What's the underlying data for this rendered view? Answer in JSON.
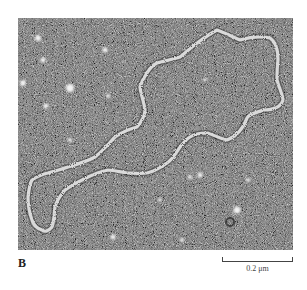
{
  "figure": {
    "panel_label": "B",
    "scale_bar": {
      "label": "0.2 μm"
    },
    "micrograph": {
      "description": "Electron micrograph of a circular DNA molecule on a granular background",
      "background_gray": "#6a6a6a",
      "strand_color": "#e8e8e8"
    }
  }
}
